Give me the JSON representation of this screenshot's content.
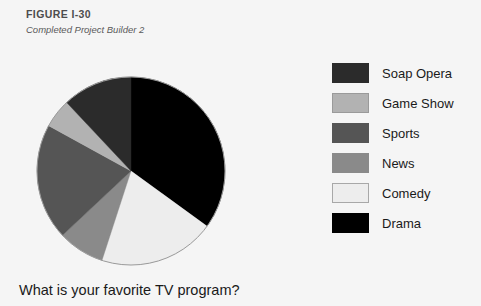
{
  "figure": {
    "number": "FIGURE I-30",
    "subtitle": "Completed Project Builder 2"
  },
  "question": "What is your favorite TV program?",
  "background_color": "#f5f5f5",
  "legend": {
    "items": [
      {
        "label": "Soap Opera",
        "color": "#2b2b2b",
        "border": "#2b2b2b"
      },
      {
        "label": "Game Show",
        "color": "#b2b2b2",
        "border": "#9a9a9a"
      },
      {
        "label": "Sports",
        "color": "#555555",
        "border": "#555555"
      },
      {
        "label": "News",
        "color": "#8a8a8a",
        "border": "#8a8a8a"
      },
      {
        "label": "Comedy",
        "color": "#ededed",
        "border": "#a8a8a8"
      },
      {
        "label": "Drama",
        "color": "#000000",
        "border": "#000000"
      }
    ]
  },
  "chart_data": {
    "type": "pie",
    "title": "What is your favorite TV program?",
    "categories": [
      "Drama",
      "Comedy",
      "News",
      "Sports",
      "Game Show",
      "Soap Opera"
    ],
    "values": [
      35,
      20,
      8,
      20,
      5,
      12
    ],
    "units": "percent",
    "colors": [
      "#000000",
      "#ededed",
      "#8a8a8a",
      "#555555",
      "#b2b2b2",
      "#2b2b2b"
    ],
    "start_angle_deg": 0,
    "direction": "clockwise",
    "legend_position": "right",
    "grid": false,
    "labels_shown": false,
    "outline_color": "#9a9a9a",
    "center": [
      95,
      95
    ],
    "radius": 94
  }
}
